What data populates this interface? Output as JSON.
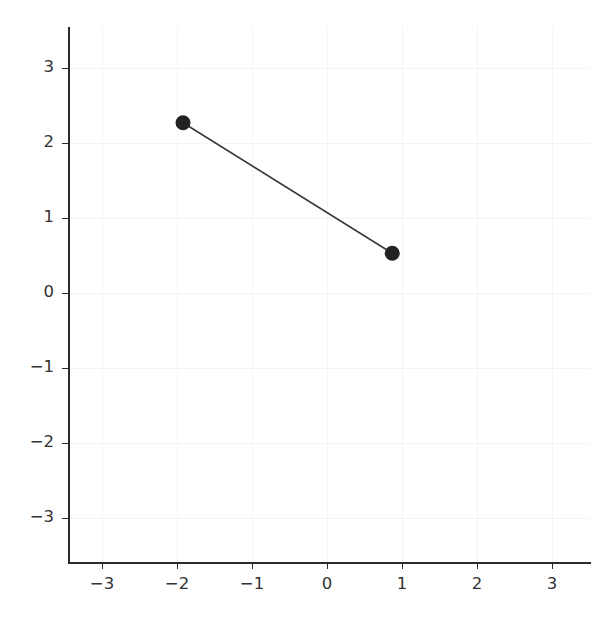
{
  "chart_data": {
    "type": "line",
    "title": "",
    "subtitle": "",
    "xlabel": "",
    "ylabel": "",
    "xlim": [
      -3.48,
      3.48
    ],
    "ylim": [
      -3.55,
      3.55
    ],
    "xticks": [
      -3,
      -2,
      -1,
      0,
      1,
      2,
      3
    ],
    "xticklabels": [
      "−3",
      "−2",
      "−1",
      "0",
      "1",
      "2",
      "3"
    ],
    "yticks": [
      -3,
      -2,
      -1,
      0,
      1,
      2,
      3
    ],
    "yticklabels": [
      "−3",
      "−2",
      "−1",
      "0",
      "1",
      "2",
      "3"
    ],
    "grid": true,
    "grid_color": "#f4f4f4",
    "legend": null,
    "legend_position": "none",
    "annotations": [],
    "series": [
      {
        "name": "segment",
        "marker": "o",
        "marker_size": 15,
        "marker_color": "#222222",
        "line_color": "#3b3b3b",
        "line_width": 1.6,
        "x": [
          -1.92,
          0.87
        ],
        "y": [
          2.27,
          0.53
        ],
        "points": [
          {
            "x": -1.92,
            "y": 2.27
          },
          {
            "x": 0.87,
            "y": 0.53
          }
        ]
      }
    ]
  },
  "style": {
    "background": "#ffffff",
    "axis_color": "#2b2b2b",
    "tick_label_color": "#333333",
    "tick_label_size": "16.5px"
  }
}
